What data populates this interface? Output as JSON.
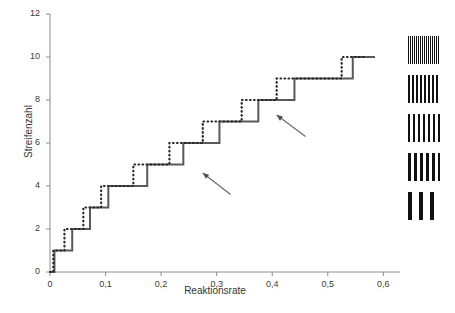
{
  "chart_data": {
    "type": "line",
    "title": "",
    "xlabel": "Reaktionsrate",
    "ylabel": "Streifenzahl",
    "xlim": [
      0,
      0.63
    ],
    "ylim": [
      0,
      12
    ],
    "grid": false,
    "legend_position": "right",
    "x_ticks": [
      "0",
      "0,1",
      "0,2",
      "0,3",
      "0,4",
      "0,5",
      "0,6"
    ],
    "x_tick_values": [
      0,
      0.1,
      0.2,
      0.3,
      0.4,
      0.5,
      0.6
    ],
    "y_ticks": [
      "0",
      "2",
      "4",
      "6",
      "8",
      "10",
      "12"
    ],
    "y_tick_values": [
      0,
      2,
      4,
      6,
      8,
      10,
      12
    ],
    "series": [
      {
        "name": "solid-step-series",
        "style": "solid",
        "color": "#595959",
        "points": [
          [
            0.0,
            0
          ],
          [
            0.008,
            0
          ],
          [
            0.008,
            1
          ],
          [
            0.04,
            1
          ],
          [
            0.04,
            2
          ],
          [
            0.072,
            2
          ],
          [
            0.072,
            3
          ],
          [
            0.105,
            3
          ],
          [
            0.105,
            4
          ],
          [
            0.175,
            4
          ],
          [
            0.175,
            5
          ],
          [
            0.24,
            5
          ],
          [
            0.24,
            6
          ],
          [
            0.305,
            6
          ],
          [
            0.305,
            7
          ],
          [
            0.375,
            7
          ],
          [
            0.375,
            8
          ],
          [
            0.44,
            8
          ],
          [
            0.44,
            9
          ],
          [
            0.545,
            9
          ],
          [
            0.545,
            10
          ],
          [
            0.585,
            10
          ]
        ]
      },
      {
        "name": "dotted-step-series",
        "style": "dotted",
        "color": "#262626",
        "points": [
          [
            0.0,
            0
          ],
          [
            0.006,
            0
          ],
          [
            0.006,
            1
          ],
          [
            0.026,
            1
          ],
          [
            0.026,
            2
          ],
          [
            0.06,
            2
          ],
          [
            0.06,
            3
          ],
          [
            0.092,
            3
          ],
          [
            0.092,
            4
          ],
          [
            0.15,
            4
          ],
          [
            0.15,
            5
          ],
          [
            0.215,
            5
          ],
          [
            0.215,
            6
          ],
          [
            0.275,
            6
          ],
          [
            0.275,
            7
          ],
          [
            0.345,
            7
          ],
          [
            0.345,
            8
          ],
          [
            0.408,
            8
          ],
          [
            0.408,
            9
          ],
          [
            0.525,
            9
          ],
          [
            0.525,
            10
          ],
          [
            0.57,
            10
          ]
        ]
      }
    ],
    "annotations": [
      {
        "name": "arrow-lower",
        "label": "",
        "tip_x": 0.275,
        "tip_y": 4.6,
        "tail_x": 0.325,
        "tail_y": 3.6
      },
      {
        "name": "arrow-upper",
        "label": "",
        "tip_x": 0.408,
        "tip_y": 7.3,
        "tail_x": 0.46,
        "tail_y": 6.3
      }
    ],
    "legend_swatches": [
      {
        "name": "stripe-swatch-finest",
        "stripe_count": 14,
        "stripe_width_px": 1
      },
      {
        "name": "stripe-swatch-fine",
        "stripe_count": 9,
        "stripe_width_px": 2
      },
      {
        "name": "stripe-swatch-medium",
        "stripe_count": 7,
        "stripe_width_px": 2
      },
      {
        "name": "stripe-swatch-coarse",
        "stripe_count": 5,
        "stripe_width_px": 3
      },
      {
        "name": "stripe-swatch-coarsest",
        "stripe_count": 3,
        "stripe_width_px": 4
      }
    ]
  },
  "axes": {
    "x_label": "Reaktionsrate",
    "y_label": "Streifenzahl",
    "x_tick_labels": [
      "0",
      "0,1",
      "0,2",
      "0,3",
      "0,4",
      "0,5",
      "0,6"
    ],
    "y_tick_labels": [
      "12",
      "10",
      "8",
      "6",
      "4",
      "2",
      "0"
    ]
  },
  "colors": {
    "axis": "#808080",
    "solid_series": "#595959",
    "dotted_series": "#262626",
    "text": "#333333",
    "background": "#ffffff"
  }
}
